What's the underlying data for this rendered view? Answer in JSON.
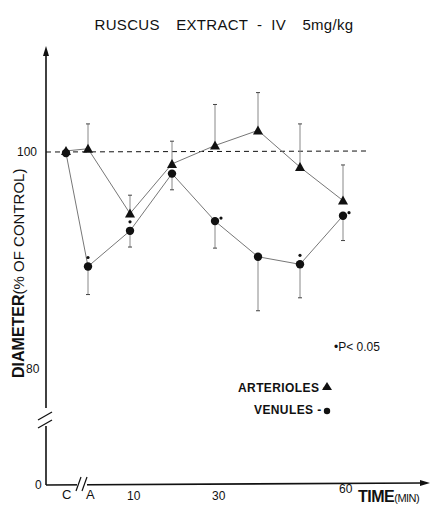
{
  "title": {
    "part1": "RUSCUS",
    "part2": "EXTRACT  -  IV",
    "part3": "5mg/kg"
  },
  "axes": {
    "y_label_main": "DIAMETER",
    "y_label_sub": "(% OF CONTROL)",
    "y_ticks": [
      "100",
      "80",
      "0"
    ],
    "x_ticks": [
      "C",
      "A",
      "10",
      "30",
      "60"
    ],
    "x_label_main": "TIME",
    "x_label_sub": "(MIN)"
  },
  "legend": {
    "significance": "•P< 0.05",
    "arterioles": "ARTERIOLES -",
    "venules": "VENULES -"
  },
  "chart_data": {
    "type": "line",
    "title": "RUSCUS EXTRACT - IV 5mg/kg",
    "xlabel": "TIME (MIN)",
    "ylabel": "DIAMETER (% OF CONTROL)",
    "x": [
      "C",
      "A",
      "10",
      "20",
      "30",
      "40",
      "50",
      "60"
    ],
    "x_ticks_labeled": [
      "C",
      "A",
      "10",
      "30",
      "60"
    ],
    "y_ticks": [
      0,
      80,
      100
    ],
    "ylim": [
      0,
      104
    ],
    "y_axis_break": "between 0 and 80",
    "x_axis_break": "between C and A",
    "reference_line": {
      "y": 100,
      "style": "dashed"
    },
    "series": [
      {
        "name": "ARTERIOLES",
        "marker": "triangle",
        "values": [
          100.1,
          100.3,
          94.3,
          98.9,
          100.6,
          102.0,
          98.6,
          95.5
        ],
        "error_upper": [
          null,
          102.6,
          96.0,
          101.0,
          104.4,
          105.5,
          102.6,
          98.8
        ],
        "significant": [
          false,
          false,
          false,
          false,
          false,
          false,
          false,
          false
        ]
      },
      {
        "name": "VENULES",
        "marker": "circle",
        "values": [
          99.9,
          89.4,
          92.7,
          98.0,
          93.6,
          90.3,
          89.6,
          94.1
        ],
        "error_lower": [
          null,
          86.8,
          91.2,
          96.5,
          91.1,
          85.3,
          86.5,
          91.8
        ],
        "significant": [
          false,
          true,
          true,
          false,
          true,
          false,
          true,
          true
        ]
      }
    ],
    "annotation": "•P< 0.05",
    "legend_position": "lower right inside plot"
  }
}
